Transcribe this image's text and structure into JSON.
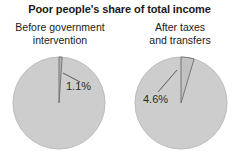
{
  "title": "Poor people's share of total income",
  "panels": [
    {
      "id": "before",
      "caption_line1": "Before government",
      "caption_line2": "intervention",
      "slice_label": "1.1%"
    },
    {
      "id": "after",
      "caption_line1": "After taxes",
      "caption_line2": "and transfers",
      "slice_label": "4.6%"
    }
  ],
  "colors": {
    "background": "#ffffff",
    "pie_fill": "#cdcdcd",
    "pie_edge": "#bcbcbc",
    "slice_fill_before": "#b4b4b4",
    "slice_fill_after": "#c2c2c2",
    "slice_edge": "#6e6e6e",
    "leader_line": "#5a5a5a",
    "text": "#1a1a1a"
  },
  "chart_data": {
    "type": "pie",
    "title": "Poor people's share of total income",
    "charts": [
      {
        "name": "Before government intervention",
        "categories": [
          "Poor people's share",
          "Rest of income"
        ],
        "values": [
          1.1,
          98.9
        ],
        "labels": [
          "1.1%",
          ""
        ],
        "units": "percent",
        "start_angle_deg": 90,
        "direction": "clockwise"
      },
      {
        "name": "After taxes and transfers",
        "categories": [
          "Poor people's share",
          "Rest of income"
        ],
        "values": [
          4.6,
          95.4
        ],
        "labels": [
          "4.6%",
          ""
        ],
        "units": "percent",
        "start_angle_deg": 90,
        "direction": "clockwise"
      }
    ],
    "xlabel": "",
    "ylabel": "",
    "legend": false,
    "grid": false
  }
}
